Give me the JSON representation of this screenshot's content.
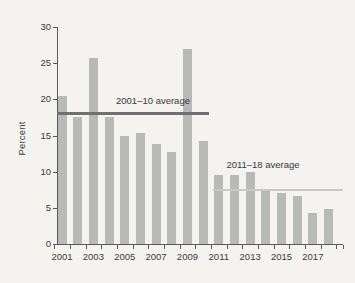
{
  "figure": {
    "background": "#f4f3ef"
  },
  "chart_data": {
    "type": "bar",
    "title": "",
    "xlabel": "",
    "ylabel": "Percent",
    "categories": [
      "2001",
      "2002",
      "2003",
      "2004",
      "2005",
      "2006",
      "2007",
      "2008",
      "2009",
      "2010",
      "2011",
      "2012",
      "2013",
      "2014",
      "2015",
      "2016",
      "2017",
      "2018"
    ],
    "values": [
      20.5,
      17.5,
      25.7,
      17.6,
      15.0,
      15.4,
      13.8,
      12.7,
      27.0,
      14.2,
      9.5,
      9.6,
      10.0,
      7.4,
      7.0,
      6.6,
      4.3,
      4.8
    ],
    "ylim": [
      0,
      30
    ],
    "yticks": [
      0,
      5,
      10,
      15,
      20,
      25,
      30
    ],
    "xtick_labels": [
      "2001",
      "2003",
      "2005",
      "2007",
      "2009",
      "2011",
      "2013",
      "2015",
      "2017"
    ],
    "grid": false,
    "legend": false,
    "bar_color": "#b7bab6",
    "axis_color": "#58595b",
    "text_color": "#3b3b3d",
    "annotations": [
      {
        "id": "avg-2001-10",
        "label": "2001–10 average",
        "value": 18,
        "span_start": "2001",
        "span_end": "2010",
        "line_color": "#6e7072",
        "line_thickness": 3,
        "label_x": 153,
        "label_y": 95
      },
      {
        "id": "avg-2011-18",
        "label": "2011–18 average",
        "value": 7.5,
        "span_start": "2011",
        "span_end": "2018",
        "line_color": "#c8cac5",
        "line_thickness": 2.5,
        "label_x": 263,
        "label_y": 159
      }
    ]
  }
}
